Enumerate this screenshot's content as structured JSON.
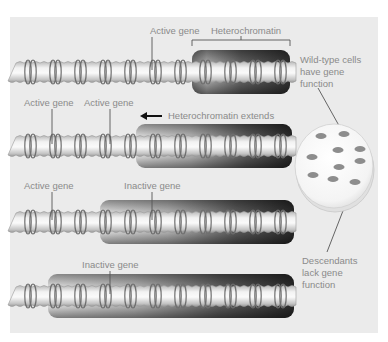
{
  "colors": {
    "panel_bg": "#ebebeb",
    "fiber_light": "#f4f4f4",
    "fiber_mid": "#d4d4d4",
    "fiber_dark": "#a9a9a9",
    "ring": "#6f6f6f",
    "hetero_light": "#cfcfcf",
    "hetero_dark": "#2b2b2b",
    "label_text": "#8a8a8a",
    "pointer_line": "#555555",
    "arrow": "#111111",
    "colony_spot": "#8d8d8d",
    "dish_fill": "#fafafa"
  },
  "rows": [
    {
      "name": "row-1",
      "labels": [
        {
          "text": "Active gene",
          "role": "active-gene"
        }
      ],
      "heterochromatin_label": "Heterochromatin"
    },
    {
      "name": "row-2",
      "labels": [
        {
          "text": "Active gene",
          "role": "active-gene"
        },
        {
          "text": "Active gene",
          "role": "active-gene"
        }
      ],
      "heterochromatin_label": "Heterochromatin extends"
    },
    {
      "name": "row-3",
      "labels": [
        {
          "text": "Active gene",
          "role": "active-gene"
        },
        {
          "text": "Inactive gene",
          "role": "inactive-gene"
        }
      ]
    },
    {
      "name": "row-4",
      "labels": [
        {
          "text": "Inactive gene",
          "role": "inactive-gene"
        }
      ]
    }
  ],
  "dish": {
    "top_label": [
      "Wild-type cells",
      "have gene",
      "function"
    ],
    "bottom_label": [
      "Descendants",
      "lack gene",
      "function"
    ]
  }
}
